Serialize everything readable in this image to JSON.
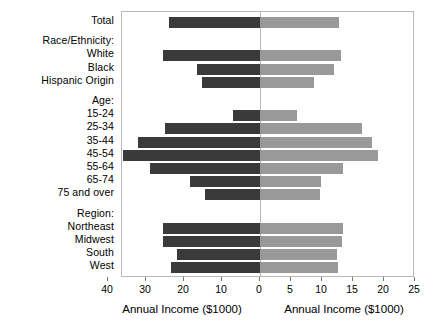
{
  "chart_data": {
    "type": "bar",
    "title": "",
    "subtitle": "",
    "orientation": "horizontal-diverging",
    "left_axis": {
      "label": "Annual Income ($1000)",
      "ticks": [
        40,
        30,
        20,
        10,
        0
      ],
      "range": [
        0,
        40
      ],
      "direction": "right-to-left"
    },
    "right_axis": {
      "label": "Annual Income ($1000)",
      "ticks": [
        0,
        5,
        10,
        15,
        20,
        25
      ],
      "range": [
        0,
        25
      ],
      "direction": "left-to-right"
    },
    "grid": false,
    "legend": null,
    "series": [
      {
        "name": "left",
        "color": "#3a3a3a"
      },
      {
        "name": "right",
        "color": "#999999"
      }
    ],
    "groups": [
      {
        "heading": "",
        "rows": [
          {
            "label": "Total",
            "left": 24.0,
            "right": 12.7
          }
        ]
      },
      {
        "heading": "Race/Ethnicity:",
        "rows": [
          {
            "label": "White",
            "left": 25.5,
            "right": 13.0
          },
          {
            "label": "Black",
            "left": 16.6,
            "right": 12.0
          },
          {
            "label": "Hispanic Origin",
            "left": 15.3,
            "right": 8.7
          }
        ]
      },
      {
        "heading": "Age:",
        "rows": [
          {
            "label": "15-24",
            "left": 7.0,
            "right": 6.0
          },
          {
            "label": "25-34",
            "left": 25.0,
            "right": 16.5
          },
          {
            "label": "35-44",
            "left": 32.0,
            "right": 18.0
          },
          {
            "label": "45-54",
            "left": 36.0,
            "right": 19.0
          },
          {
            "label": "55-64",
            "left": 29.0,
            "right": 13.4
          },
          {
            "label": "65-74",
            "left": 18.4,
            "right": 9.8
          },
          {
            "label": "75 and over",
            "left": 14.5,
            "right": 9.7
          }
        ]
      },
      {
        "heading": "Region:",
        "rows": [
          {
            "label": "Northeast",
            "left": 25.5,
            "right": 13.4
          },
          {
            "label": "Midwest",
            "left": 25.5,
            "right": 13.2
          },
          {
            "label": "South",
            "left": 21.8,
            "right": 12.4
          },
          {
            "label": "West",
            "left": 23.4,
            "right": 12.6
          }
        ]
      }
    ]
  },
  "colors": {
    "bar_left": "#3a3a3a",
    "bar_right": "#999999",
    "frame": "#b9b9b9",
    "text": "#000000"
  }
}
